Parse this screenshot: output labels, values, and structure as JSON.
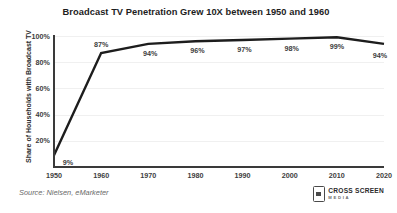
{
  "chart_data": {
    "type": "line",
    "title": "Broadcast TV Penetration Grew 10X between 1950 and 1960",
    "xlabel": "",
    "ylabel": "Share of Households with Broadcast TV",
    "categories": [
      "1950",
      "1960",
      "1970",
      "1980",
      "1990",
      "2000",
      "2010",
      "2020"
    ],
    "x": [
      1950,
      1960,
      1970,
      1980,
      1990,
      2000,
      2010,
      2020
    ],
    "values": [
      9,
      87,
      94,
      96,
      97,
      98,
      99,
      94
    ],
    "point_labels": [
      "9%",
      "87%",
      "94%",
      "96%",
      "97%",
      "98%",
      "99%",
      "94%"
    ],
    "ylim": [
      0,
      100
    ],
    "xlim": [
      1950,
      2020
    ],
    "y_ticks": [
      20,
      40,
      60,
      80,
      100
    ],
    "y_tick_labels": [
      "20%",
      "40%",
      "60%",
      "80%",
      "100%"
    ],
    "x_tick_labels": [
      "1950",
      "1960",
      "1970",
      "1980",
      "1990",
      "2000",
      "2010",
      "2020"
    ],
    "grid": "horizontal",
    "legend": "none",
    "line_color": "#1d1d1d",
    "grid_color": "#f0f0f0",
    "axis_color": "#3a3a3a",
    "background": "#ffffff"
  },
  "footer": {
    "source": "Source: Nielsen, eMarketer",
    "brand_name": "CROSS SCREEN",
    "brand_sub": "MEDIA"
  }
}
